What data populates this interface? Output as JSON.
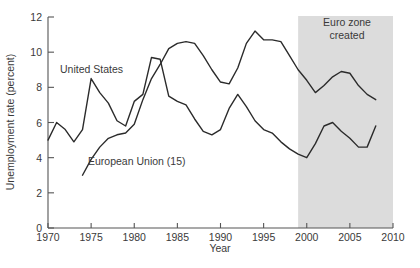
{
  "chart_data": {
    "type": "line",
    "title": "",
    "xlabel": "Year",
    "ylabel": "Unemployment rate (percent)",
    "xlim": [
      1970,
      2010
    ],
    "ylim": [
      0,
      12
    ],
    "xticks": [
      1970,
      1975,
      1980,
      1985,
      1990,
      1995,
      2000,
      2005,
      2010
    ],
    "xtick_labels": [
      "1970",
      "1975",
      "1980",
      "1985",
      "1990",
      "1995",
      "2000",
      "2005",
      "2010"
    ],
    "yticks": [
      0,
      2,
      4,
      6,
      8,
      10,
      12
    ],
    "ytick_labels": [
      "0",
      "2",
      "4",
      "6",
      "8",
      "10",
      "12"
    ],
    "grid": false,
    "legend_position": "inline-annotation",
    "line_color": "#2b2b2b",
    "shade_color": "#dcdcdc",
    "annotations": [
      {
        "name": "euro-zone-created",
        "text_line_1": "Euro zone",
        "text_line_2": "created",
        "span_start_year": 1999,
        "span_end_year": 2010
      }
    ],
    "series": [
      {
        "name": "United States",
        "label": "United States",
        "x": [
          1970,
          1971,
          1972,
          1973,
          1974,
          1975,
          1976,
          1977,
          1978,
          1979,
          1980,
          1981,
          1982,
          1983,
          1984,
          1985,
          1986,
          1987,
          1988,
          1989,
          1990,
          1991,
          1992,
          1993,
          1994,
          1995,
          1996,
          1997,
          1998,
          1999,
          2000,
          2001,
          2002,
          2003,
          2004,
          2005,
          2006,
          2007,
          2008
        ],
        "y": [
          5.0,
          6.0,
          5.6,
          4.9,
          5.6,
          8.5,
          7.7,
          7.1,
          6.1,
          5.8,
          7.2,
          7.6,
          9.7,
          9.6,
          7.5,
          7.2,
          7.0,
          6.2,
          5.5,
          5.3,
          5.6,
          6.8,
          7.6,
          6.9,
          6.1,
          5.6,
          5.4,
          4.9,
          4.5,
          4.2,
          4.0,
          4.8,
          5.8,
          6.0,
          5.5,
          5.1,
          4.6,
          4.6,
          5.8
        ]
      },
      {
        "name": "European Union (15)",
        "label": "European Union (15)",
        "x": [
          1974,
          1975,
          1976,
          1977,
          1978,
          1979,
          1980,
          1981,
          1982,
          1983,
          1984,
          1985,
          1986,
          1987,
          1988,
          1989,
          1990,
          1991,
          1992,
          1993,
          1994,
          1995,
          1996,
          1997,
          1998,
          1999,
          2000,
          2001,
          2002,
          2003,
          2004,
          2005,
          2006,
          2007,
          2008
        ],
        "y": [
          3.0,
          3.9,
          4.6,
          5.1,
          5.3,
          5.4,
          5.9,
          7.3,
          8.5,
          9.3,
          10.2,
          10.5,
          10.6,
          10.5,
          9.8,
          9.0,
          8.3,
          8.2,
          9.1,
          10.5,
          11.2,
          10.7,
          10.7,
          10.6,
          9.8,
          9.0,
          8.4,
          7.7,
          8.1,
          8.6,
          8.9,
          8.8,
          8.1,
          7.6,
          7.3
        ]
      }
    ]
  }
}
